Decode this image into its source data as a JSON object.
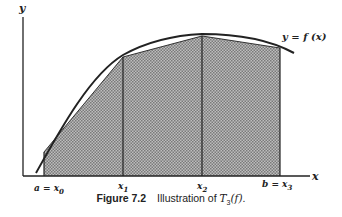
{
  "figure": {
    "number": "Figure 7.2",
    "caption_prefix": "Illustration of ",
    "caption_math": "T",
    "caption_math_sub": "3",
    "caption_math_arg": "(f)",
    "caption_suffix": "."
  },
  "axes": {
    "x_label": "x",
    "y_label": "y",
    "curve_label": "y = f (x)"
  },
  "ticks": [
    {
      "prefix": "a = x",
      "sub": "0"
    },
    {
      "prefix": "x",
      "sub": "1"
    },
    {
      "prefix": "x",
      "sub": "2"
    },
    {
      "prefix": "b = x",
      "sub": "3"
    }
  ],
  "colors": {
    "fill": "#a8a8a8",
    "line": "#222222"
  },
  "diagram_data": {
    "type": "trapezoidal-rule-illustration",
    "nodes": [
      "a = x0",
      "x1",
      "x2",
      "b = x3"
    ],
    "panels": 3,
    "description": "Concave curve y = f(x) over [a,b] approximated by 3 shaded trapezoids with vertices at x0..x3"
  }
}
